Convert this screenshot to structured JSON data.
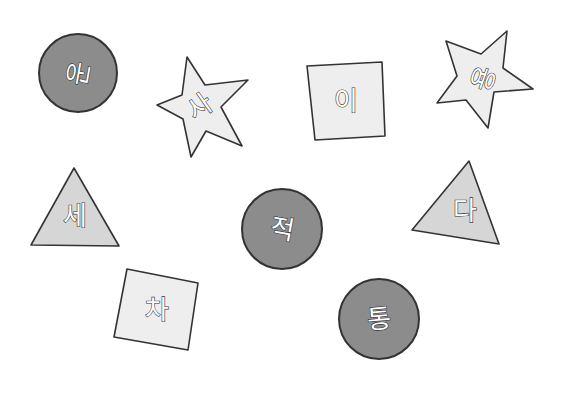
{
  "shapes": [
    {
      "id": "gong",
      "shape": "circle",
      "fill": "dark-gray",
      "syllable": "공"
    },
    {
      "id": "sa",
      "shape": "star",
      "fill": "light-gray",
      "syllable": "사"
    },
    {
      "id": "i",
      "shape": "square",
      "fill": "light-gray",
      "syllable": "이"
    },
    {
      "id": "yong",
      "shape": "star",
      "fill": "light-gray",
      "syllable": "용"
    },
    {
      "id": "se",
      "shape": "triangle",
      "fill": "mid-gray",
      "syllable": "세"
    },
    {
      "id": "jeok",
      "shape": "circle",
      "fill": "dark-gray",
      "syllable": "적"
    },
    {
      "id": "da",
      "shape": "triangle",
      "fill": "mid-gray",
      "syllable": "다"
    },
    {
      "id": "cha",
      "shape": "square",
      "fill": "light-gray",
      "syllable": "차"
    },
    {
      "id": "tong",
      "shape": "circle",
      "fill": "dark-gray",
      "syllable": "통"
    }
  ],
  "colors": {
    "dark": "#8c8c8c",
    "light": "#eeeeee",
    "triangle": "#d6d6d6",
    "outline": "#333333"
  }
}
